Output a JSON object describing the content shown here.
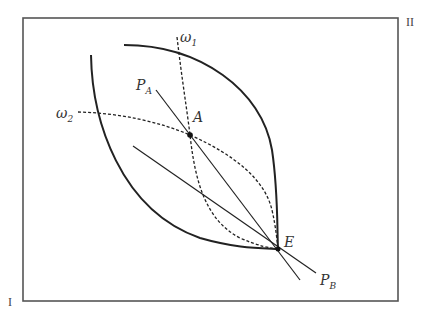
{
  "diagram": {
    "type": "edgeworth-box",
    "colors": {
      "ink": "#222222",
      "frame": "#555555",
      "background": "#ffffff"
    },
    "corners": {
      "origin_I": "I",
      "origin_II": "II"
    },
    "points": {
      "A": {
        "label": "A",
        "x": 190,
        "y": 135
      },
      "E": {
        "label": "E",
        "x": 278,
        "y": 249
      }
    },
    "labels": {
      "omega1": {
        "base": "ω",
        "sub": "1"
      },
      "omega2": {
        "base": "ω",
        "sub": "2"
      },
      "PA": {
        "base": "P",
        "sub": "A"
      },
      "PB": {
        "base": "P",
        "sub": "B"
      },
      "A": "A",
      "E": "E"
    },
    "curves": [
      {
        "name": "indifference-curve-I",
        "style": "solid-thick"
      },
      {
        "name": "indifference-curve-II",
        "style": "solid-thick"
      },
      {
        "name": "offer-curve-omega1",
        "style": "dashed"
      },
      {
        "name": "offer-curve-omega2",
        "style": "dashed"
      },
      {
        "name": "price-line-PA",
        "style": "solid-thin"
      },
      {
        "name": "price-line-PB",
        "style": "solid-thin"
      }
    ]
  }
}
